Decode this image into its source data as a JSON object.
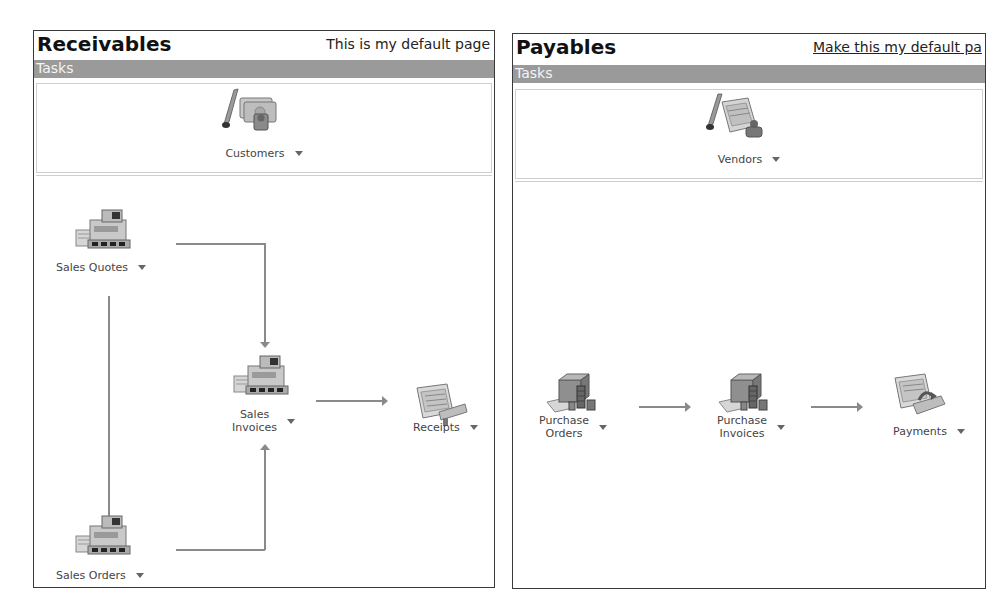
{
  "receivables": {
    "title": "Receivables",
    "default_link": "This is my default page",
    "tasks_label": "Tasks",
    "top_node": {
      "label": "Customers",
      "icon": "customers-icon"
    },
    "nodes": [
      {
        "id": "sales-quotes",
        "label": "Sales Quotes",
        "icon": "cash-register-icon"
      },
      {
        "id": "sales-invoices",
        "label_line1": "Sales",
        "label_line2": "Invoices",
        "icon": "cash-register-icon"
      },
      {
        "id": "receipts",
        "label": "Receipts",
        "icon": "receipt-icon"
      },
      {
        "id": "sales-orders",
        "label": "Sales Orders",
        "icon": "cash-register-icon"
      }
    ]
  },
  "payables": {
    "title": "Payables",
    "default_link": "Make this my default pa",
    "tasks_label": "Tasks",
    "top_node": {
      "label": "Vendors",
      "icon": "vendors-icon"
    },
    "nodes": [
      {
        "id": "purchase-orders",
        "label_line1": "Purchase",
        "label_line2": "Orders",
        "icon": "purchase-icon"
      },
      {
        "id": "purchase-invoices",
        "label_line1": "Purchase",
        "label_line2": "Invoices",
        "icon": "purchase-icon"
      },
      {
        "id": "payments",
        "label": "Payments",
        "icon": "payment-icon"
      }
    ]
  }
}
